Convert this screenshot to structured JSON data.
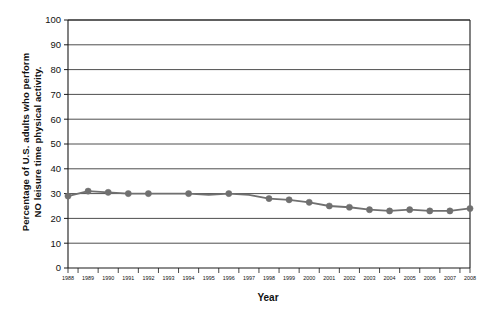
{
  "chart_data": {
    "type": "line",
    "title": "",
    "xlabel": "Year",
    "ylabel_line1": "Percentage of U.S. adults who perform",
    "ylabel_line2": "NO leisure time physical activity.",
    "categories": [
      "1988",
      "1989",
      "1990",
      "1991",
      "1992",
      "1993",
      "1994",
      "1995",
      "1996",
      "1997",
      "1998",
      "1999",
      "2000",
      "2001",
      "2002",
      "2003",
      "2004",
      "2005",
      "2006",
      "2007",
      "2008"
    ],
    "values": [
      29,
      31,
      30.5,
      30,
      30,
      30,
      30,
      29.5,
      30,
      29.5,
      28,
      27.5,
      26.5,
      25,
      24.5,
      23.5,
      23,
      23.5,
      23,
      23,
      24
    ],
    "x": [
      1988,
      1989,
      1990,
      1991,
      1992,
      1993,
      1994,
      1995,
      1996,
      1997,
      1998,
      1999,
      2000,
      2001,
      2002,
      2003,
      2004,
      2005,
      2006,
      2007,
      2008
    ],
    "markers_at": [
      1988,
      1989,
      1990,
      1991,
      1992,
      1994,
      1996,
      1998,
      1999,
      2000,
      2001,
      2002,
      2003,
      2004,
      2005,
      2006,
      2007,
      2008
    ],
    "ylim": [
      0,
      100
    ],
    "xlim": [
      1988,
      2008
    ],
    "yticks": [
      0,
      10,
      20,
      30,
      40,
      50,
      60,
      70,
      80,
      90,
      100
    ],
    "ytick_labels": [
      "0",
      "10",
      "20",
      "30",
      "40",
      "50",
      "60",
      "70",
      "80",
      "90",
      "100"
    ],
    "grid": true,
    "legend": "none",
    "series_color": "#707070",
    "axis_color": "#1a1a1a",
    "grid_color": "#3a3a3a",
    "background": "#ffffff"
  }
}
